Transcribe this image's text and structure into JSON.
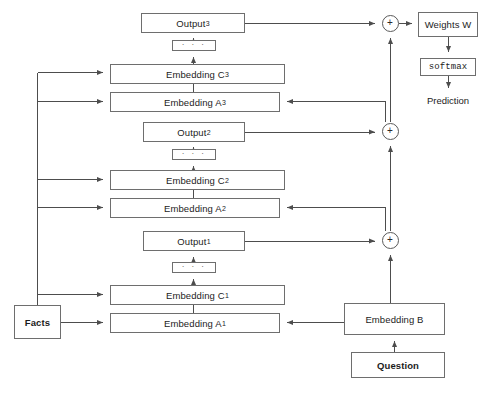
{
  "diagram": {
    "colors": {
      "stroke": "#6e6e6e",
      "wire": "#4d4d4d",
      "text": "#1c1c1c",
      "background": "#ffffff"
    },
    "boxes": [
      {
        "id": "output3",
        "label": "Output",
        "subscript": "3",
        "x": 141,
        "y": 13,
        "w": 104,
        "h": 20,
        "style": "plain"
      },
      {
        "id": "dots3",
        "label": "· · ·",
        "subscript": "",
        "x": 172,
        "y": 40,
        "w": 44,
        "h": 11,
        "style": "dots"
      },
      {
        "id": "embedding_c3",
        "label": "Embedding C",
        "subscript": "3",
        "x": 110,
        "y": 64,
        "w": 175,
        "h": 20,
        "style": "plain"
      },
      {
        "id": "embedding_a3",
        "label": "Embedding A",
        "subscript": "3",
        "x": 110,
        "y": 92,
        "w": 170,
        "h": 20,
        "style": "plain"
      },
      {
        "id": "output2",
        "label": "Output",
        "subscript": "2",
        "x": 143,
        "y": 122,
        "w": 102,
        "h": 20,
        "style": "plain"
      },
      {
        "id": "dots2",
        "label": "· · ·",
        "subscript": "",
        "x": 172,
        "y": 149,
        "w": 44,
        "h": 11,
        "style": "dots"
      },
      {
        "id": "embedding_c2",
        "label": "Embedding C",
        "subscript": "2",
        "x": 110,
        "y": 170,
        "w": 175,
        "h": 20,
        "style": "plain"
      },
      {
        "id": "embedding_a2",
        "label": "Embedding A",
        "subscript": "2",
        "x": 110,
        "y": 198,
        "w": 170,
        "h": 20,
        "style": "plain"
      },
      {
        "id": "output1",
        "label": "Output",
        "subscript": "1",
        "x": 143,
        "y": 231,
        "w": 102,
        "h": 20,
        "style": "plain"
      },
      {
        "id": "dots1",
        "label": "· · ·",
        "subscript": "",
        "x": 172,
        "y": 262,
        "w": 44,
        "h": 11,
        "style": "dots"
      },
      {
        "id": "embedding_c1",
        "label": "Embedding C",
        "subscript": "1",
        "x": 110,
        "y": 285,
        "w": 175,
        "h": 20,
        "style": "plain"
      },
      {
        "id": "embedding_a1",
        "label": "Embedding A",
        "subscript": "1",
        "x": 110,
        "y": 313,
        "w": 170,
        "h": 20,
        "style": "plain"
      },
      {
        "id": "facts",
        "label": "Facts",
        "subscript": "",
        "x": 14,
        "y": 305,
        "w": 47,
        "h": 34,
        "style": "bold"
      },
      {
        "id": "embedding_b",
        "label": "Embedding B",
        "subscript": "",
        "x": 344,
        "y": 303,
        "w": 101,
        "h": 32,
        "style": "plain"
      },
      {
        "id": "question",
        "label": "Question",
        "subscript": "",
        "x": 351,
        "y": 352,
        "w": 94,
        "h": 26,
        "style": "bold"
      },
      {
        "id": "weights_w",
        "label": "Weights W",
        "subscript": "",
        "x": 418,
        "y": 12,
        "w": 60,
        "h": 25,
        "style": "plain"
      },
      {
        "id": "softmax",
        "label": "softmax",
        "subscript": "",
        "x": 420,
        "y": 58,
        "w": 56,
        "h": 18,
        "style": "mono"
      }
    ],
    "adders": [
      {
        "id": "sum3",
        "label": "+",
        "cx": 390,
        "cy": 23
      },
      {
        "id": "sum2",
        "label": "+",
        "cx": 390,
        "cy": 131
      },
      {
        "id": "sum1",
        "label": "+",
        "cx": 390,
        "cy": 240
      }
    ],
    "free_labels": [
      {
        "id": "prediction",
        "label": "Prediction",
        "x": 418,
        "y": 95,
        "w": 60
      }
    ],
    "legend": {
      "facts_input": "Facts",
      "question_input": "Question",
      "output_label": "Prediction",
      "hops": 3
    }
  }
}
